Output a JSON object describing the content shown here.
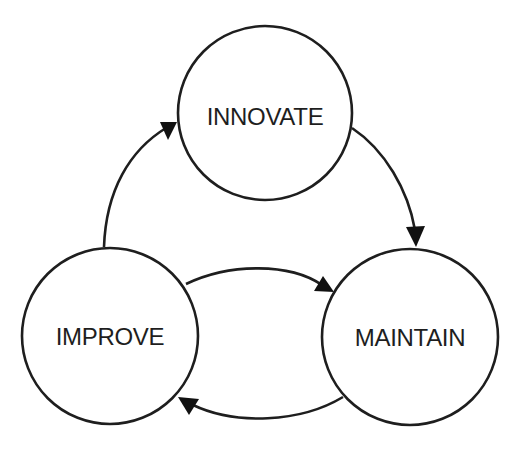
{
  "diagram": {
    "type": "cycle",
    "colors": {
      "stroke": "#1e1e1e",
      "fill": "#ffffff",
      "text": "#1e1e1e",
      "background": "#ffffff"
    },
    "nodes": [
      {
        "id": "innovate",
        "label": "INNOVATE",
        "cx": 265,
        "cy": 113,
        "r": 87
      },
      {
        "id": "improve",
        "label": "IMPROVE",
        "cx": 110,
        "cy": 336,
        "r": 88
      },
      {
        "id": "maintain",
        "label": "MAINTAIN",
        "cx": 410,
        "cy": 337,
        "r": 88
      }
    ],
    "edges": [
      {
        "from": "improve",
        "to": "innovate"
      },
      {
        "from": "innovate",
        "to": "maintain"
      },
      {
        "from": "improve",
        "to": "maintain"
      },
      {
        "from": "maintain",
        "to": "improve"
      }
    ]
  }
}
